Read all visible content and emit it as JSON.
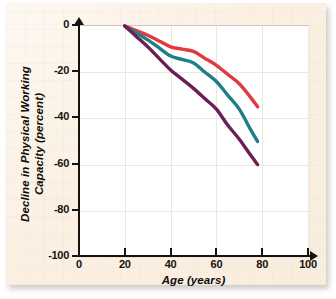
{
  "chart_data": {
    "type": "line",
    "title": "",
    "xlabel": "Age (years)",
    "ylabel": "Decline in Physical Working Capacity (percent)",
    "ylabel_line1": "Decline in Physical Working",
    "ylabel_line2": "Capacity (percent)",
    "xlim": [
      0,
      100
    ],
    "ylim": [
      -100,
      0
    ],
    "xticks": [
      0,
      20,
      40,
      60,
      80,
      100
    ],
    "yticks": [
      0,
      -20,
      -40,
      -60,
      -80,
      -100
    ],
    "xtick_labels": [
      "0",
      "20",
      "40",
      "60",
      "80",
      "100"
    ],
    "ytick_labels": [
      "0",
      "-20",
      "-40",
      "-60",
      "-80",
      "-100"
    ],
    "grid": true,
    "legend": "none",
    "series": [
      {
        "name": "upper-curve",
        "color": "#e03a3e",
        "x": [
          20,
          25,
          30,
          35,
          40,
          45,
          50,
          55,
          60,
          65,
          70,
          75,
          78
        ],
        "values": [
          0,
          -2,
          -4,
          -6.5,
          -9,
          -10,
          -11,
          -14,
          -17,
          -21,
          -25,
          -31,
          -35
        ]
      },
      {
        "name": "middle-curve",
        "color": "#1f7f87",
        "x": [
          20,
          25,
          30,
          35,
          40,
          45,
          50,
          55,
          60,
          65,
          70,
          75,
          78
        ],
        "values": [
          0,
          -3,
          -6,
          -9.5,
          -13,
          -14.5,
          -16,
          -20,
          -24,
          -30,
          -36,
          -45,
          -50
        ]
      },
      {
        "name": "lower-curve",
        "color": "#6b1f52",
        "x": [
          20,
          25,
          30,
          35,
          40,
          45,
          50,
          55,
          60,
          65,
          70,
          75,
          78
        ],
        "values": [
          0,
          -4.5,
          -9,
          -14,
          -19,
          -23,
          -27,
          -31.5,
          -36,
          -43,
          -49,
          -56,
          -60
        ]
      }
    ]
  },
  "axes": {
    "x_title": "Age (years)",
    "y_title_line1": "Decline in Physical Working",
    "y_title_line2": "Capacity (percent)",
    "x_ticks": [
      {
        "label": "0",
        "value": 0
      },
      {
        "label": "20",
        "value": 20
      },
      {
        "label": "40",
        "value": 40
      },
      {
        "label": "60",
        "value": 60
      },
      {
        "label": "80",
        "value": 80
      },
      {
        "label": "100",
        "value": 100
      }
    ],
    "y_ticks": [
      {
        "label": "0",
        "value": 0
      },
      {
        "label": "-20",
        "value": -20
      },
      {
        "label": "-40",
        "value": -40
      },
      {
        "label": "-60",
        "value": -60
      },
      {
        "label": "-80",
        "value": -80
      },
      {
        "label": "-100",
        "value": -100
      }
    ]
  },
  "colors": {
    "paper": "#fbf0e2",
    "plot_background": "#ffffff",
    "axis": "#15120f",
    "grid": "#ece6de",
    "series_upper": "#e03a3e",
    "series_middle": "#1f7f87",
    "series_lower": "#6b1f52"
  }
}
